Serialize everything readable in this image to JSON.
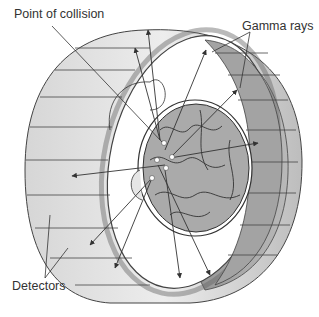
{
  "diagram": {
    "labels": {
      "point_of_collision": "Point of collision",
      "gamma_rays": "Gamma rays",
      "detectors": "Detectors"
    },
    "colors": {
      "ring_light": "#e4e4e4",
      "ring_mid": "#bdbdbd",
      "ring_dark": "#9a9a9a",
      "brain": "#a8a8a8",
      "line": "#333333",
      "text": "#333333"
    }
  }
}
